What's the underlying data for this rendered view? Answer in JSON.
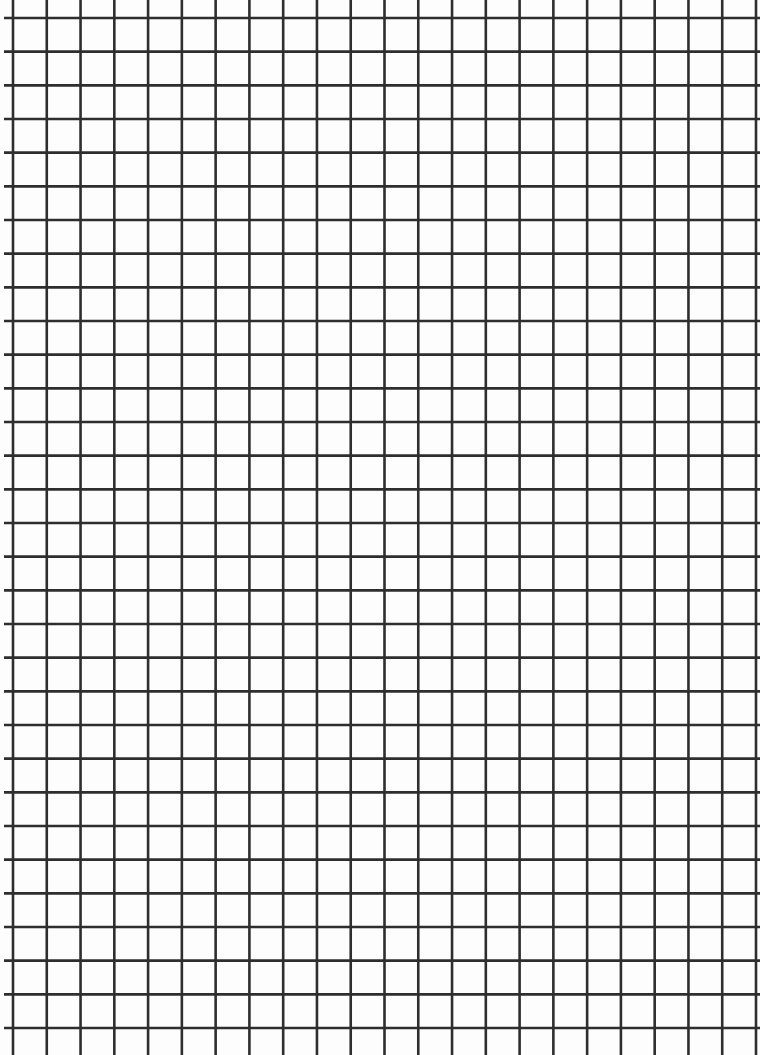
{
  "sheet": {
    "type": "graph-paper",
    "background_color": "#fdfdfd",
    "line_color": "#2e2e2e",
    "line_width": 2.6,
    "vertical_lines": {
      "count": 23,
      "start_x": 13,
      "end_x": 756
    },
    "horizontal_lines": {
      "count": 31,
      "start_y": 18,
      "end_y": 1028
    }
  }
}
